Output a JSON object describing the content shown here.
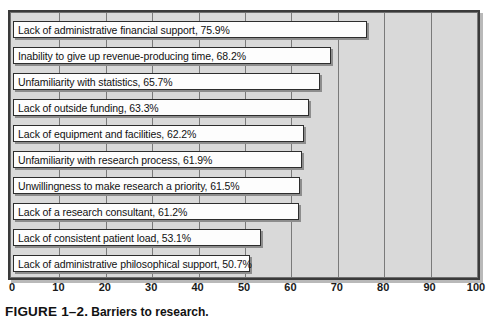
{
  "chart_data": {
    "type": "bar",
    "orientation": "horizontal",
    "title": "Barriers to research.",
    "figure_number": "FIGURE 1–2.",
    "xlabel": "",
    "ylabel": "",
    "xlim": [
      0,
      100
    ],
    "xticks": [
      0,
      10,
      20,
      30,
      40,
      50,
      60,
      70,
      80,
      90,
      100
    ],
    "xticklabels": [
      "0",
      "10",
      "20",
      "30",
      "40",
      "50",
      "60",
      "70",
      "80",
      "90",
      "100"
    ],
    "grid": true,
    "legend": false,
    "categories": [
      "Lack of administrative financial support",
      "Inability to give up revenue-producing time",
      "Unfamiliarity with statistics",
      "Lack of outside funding",
      "Lack of equipment and facilities",
      "Unfamiliarity with research process",
      "Unwillingness to make research a priority",
      "Lack of a research consultant",
      "Lack of consistent patient load",
      "Lack of administrative philosophical support"
    ],
    "values": [
      75.9,
      68.2,
      65.7,
      63.3,
      62.2,
      61.9,
      61.5,
      61.2,
      53.1,
      50.7
    ],
    "bar_labels": [
      "Lack of administrative financial support, 75.9%",
      "Inability to give up revenue-producing time, 68.2%",
      "Unfamiliarity with statistics, 65.7%",
      "Lack of outside funding, 63.3%",
      "Lack of equipment and facilities, 62.2%",
      "Unfamiliarity with research process, 61.9%",
      "Unwillingness to make research a priority, 61.5%",
      "Lack of a research consultant, 61.2%",
      "Lack of consistent patient load, 53.1%",
      "Lack of administrative philosophical support, 50.7%"
    ],
    "colors": {
      "bar_fill": "#fdfdfd",
      "bar_edge": "#2d2d2d",
      "plot_background": "#d9d9d9",
      "grid_color": "#7a7a7a",
      "frame_color": "#3a3a3a",
      "text_color": "#111111"
    }
  },
  "caption": {
    "figure_number": "FIGURE 1–2.",
    "text": "Barriers to research."
  }
}
